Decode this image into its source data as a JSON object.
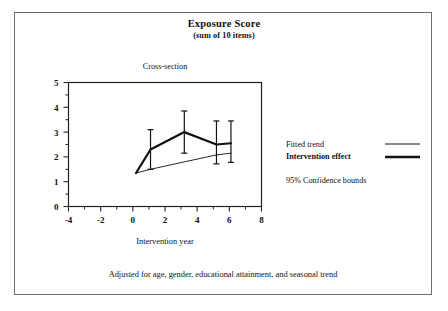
{
  "title": "Exposure Score",
  "subtitle": "(sum of 10 items)",
  "panel_title": "Cross-section",
  "footer": "Adjusted for age, gender, educational attainment, and seasonal trend",
  "legend": {
    "fitted_label": "Fitted trend",
    "intervention_label": "Intervention effect",
    "ci_label": "95% Confidence bounds"
  },
  "axes": {
    "xlabel": "Intervention year",
    "ylabel": "",
    "xticks": [
      "-4",
      "-2",
      "0",
      "2",
      "4",
      "6",
      "8"
    ],
    "yticks": [
      "0",
      "1",
      "2",
      "3",
      "4",
      "5"
    ]
  },
  "colors": {
    "line": "#111111",
    "frame": "#222222",
    "border": "#6f6f6f",
    "background": "#ffffff"
  },
  "chart_data": {
    "type": "line",
    "title": "Exposure Score",
    "subtitle": "(sum of 10 items)",
    "panel_title": "Cross-section",
    "xlabel": "Intervention year",
    "ylabel": "Exposure Score (sum of 10 items)",
    "xlim": [
      -4,
      8
    ],
    "ylim": [
      0,
      5
    ],
    "xticks": [
      -4,
      -2,
      0,
      2,
      4,
      6,
      8
    ],
    "yticks": [
      0,
      1,
      2,
      3,
      4,
      5
    ],
    "xminorticks": [
      -3,
      -1,
      1,
      3,
      5,
      7
    ],
    "yminorticks": [
      0.5,
      1.5,
      2.5,
      3.5,
      4.5
    ],
    "grid": false,
    "legend_position": "right-outside",
    "annotation": "Adjusted for age, gender, educational attainment, and seasonal trend",
    "series": [
      {
        "name": "Intervention effect",
        "style": "thick-solid",
        "linewidth": 2.2,
        "x": [
          0.2,
          1.1,
          3.2,
          5.2,
          6.1
        ],
        "values": [
          1.35,
          2.3,
          3.0,
          2.5,
          2.55
        ]
      },
      {
        "name": "Fitted trend",
        "style": "thin-solid",
        "linewidth": 0.9,
        "x": [
          0.2,
          1.1,
          3.2,
          5.2,
          6.1
        ],
        "values": [
          1.35,
          1.5,
          1.8,
          2.08,
          2.15
        ]
      }
    ],
    "error_bars": {
      "name": "95% Confidence bounds",
      "x": [
        1.1,
        3.2,
        5.2,
        6.1
      ],
      "lower": [
        1.5,
        2.15,
        1.72,
        1.78
      ],
      "upper": [
        3.1,
        3.85,
        3.45,
        3.45
      ]
    }
  }
}
